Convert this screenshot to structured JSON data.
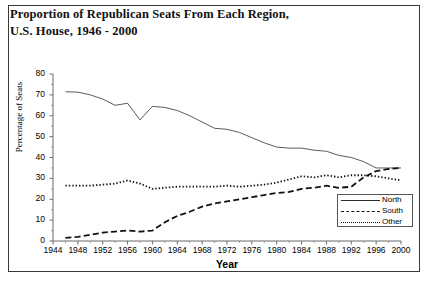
{
  "figure": {
    "title_lines": [
      "Proportion of Republican Seats From Each Region,",
      "U.S. House, 1946 - 2000"
    ]
  },
  "chart_data": {
    "type": "line",
    "title": "Proportion of Republican Seats From Each Region, U.S. House, 1946 - 2000",
    "xlabel": "Year",
    "ylabel": "Percentage of Seats",
    "xlim": [
      1944,
      2000
    ],
    "ylim": [
      0,
      80
    ],
    "grid": false,
    "legend_position": "bottom-right",
    "xticks": [
      1944,
      1948,
      1952,
      1956,
      1960,
      1964,
      1968,
      1972,
      1976,
      1980,
      1984,
      1988,
      1992,
      1996,
      2000
    ],
    "xtick_labels": [
      "1944",
      "1948",
      "1952",
      "1956",
      "1960",
      "1964",
      "1968",
      "1972",
      "1976",
      "1980",
      "1984",
      "1988",
      "1992",
      "1996",
      "2000"
    ],
    "xminor_step": 2,
    "yticks": [
      0,
      10,
      20,
      30,
      40,
      50,
      60,
      70,
      80
    ],
    "ytick_labels": [
      "0",
      "10",
      "20",
      "30",
      "40",
      "50",
      "60",
      "70",
      "80"
    ],
    "x": [
      1946,
      1948,
      1950,
      1952,
      1954,
      1956,
      1958,
      1960,
      1962,
      1964,
      1966,
      1968,
      1970,
      1972,
      1974,
      1976,
      1978,
      1980,
      1982,
      1984,
      1986,
      1988,
      1990,
      1992,
      1994,
      1996,
      1998,
      2000
    ],
    "series": [
      {
        "name": "North",
        "style": "solid",
        "values": [
          71.5,
          71.3,
          70.0,
          68.0,
          65.0,
          66.0,
          58.0,
          64.5,
          64.0,
          62.5,
          60.0,
          57.0,
          54.0,
          53.5,
          52.0,
          49.5,
          47.0,
          45.0,
          44.5,
          44.5,
          43.5,
          43.0,
          41.0,
          40.0,
          38.0,
          35.0,
          35.0,
          35.0
        ]
      },
      {
        "name": "South",
        "style": "dashed",
        "values": [
          1.5,
          2.0,
          3.0,
          4.0,
          4.5,
          5.0,
          4.5,
          5.0,
          9.0,
          12.0,
          14.0,
          16.5,
          18.0,
          19.0,
          20.0,
          21.0,
          22.0,
          23.0,
          23.5,
          25.0,
          25.5,
          26.5,
          25.5,
          26.0,
          30.5,
          33.5,
          34.5,
          35.0
        ]
      },
      {
        "name": "Other",
        "style": "dotted",
        "values": [
          26.5,
          26.5,
          26.5,
          27.0,
          27.5,
          29.0,
          27.5,
          25.0,
          25.5,
          26.0,
          26.0,
          26.0,
          26.0,
          26.5,
          26.0,
          26.5,
          27.0,
          28.0,
          29.5,
          31.0,
          30.5,
          31.5,
          30.5,
          31.5,
          31.5,
          31.0,
          30.0,
          29.0
        ]
      }
    ]
  },
  "legend": {
    "items": [
      {
        "label": "North"
      },
      {
        "label": "South"
      },
      {
        "label": "Other"
      }
    ]
  }
}
